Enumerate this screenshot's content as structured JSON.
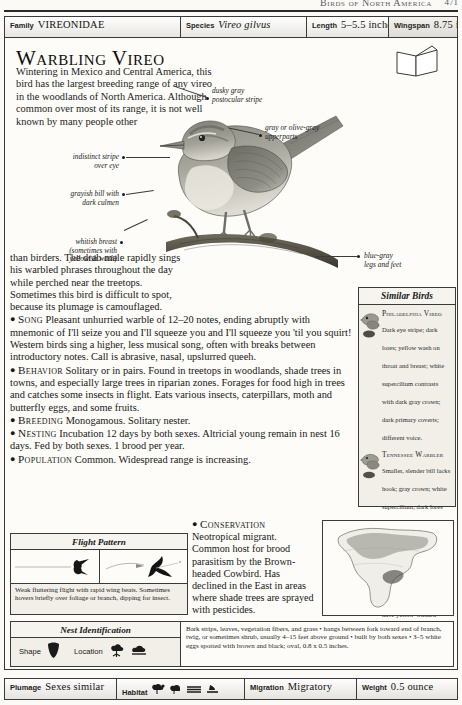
{
  "running_head": {
    "text": "Birds of North America",
    "page_number": "471"
  },
  "header": {
    "cells": [
      {
        "key": "Family",
        "value": "VIREONIDAE",
        "style": "smallcaps"
      },
      {
        "key": "Species",
        "value": "Vireo gilvus",
        "style": "italic"
      },
      {
        "key": "Length",
        "value": "5–5.5 inches",
        "style": "plain"
      },
      {
        "key": "Wingspan",
        "value": "8.75 inches",
        "style": "plain"
      }
    ]
  },
  "title": "Warbling Vireo",
  "intro": "Wintering in Mexico and Central America, this bird has the largest breeding range of any vireo in the woodlands of North America. Although common over most of its range, it is not well known by many people other",
  "callouts": [
    {
      "name": "postocular-stripe",
      "text": "dusky gray\npostocular stripe"
    },
    {
      "name": "upperparts",
      "text": "gray or olive-gray\nupperparts"
    },
    {
      "name": "eye-stripe",
      "text": "indistinct stripe\nover eye"
    },
    {
      "name": "bill",
      "text": "grayish bill with\ndark culmen"
    },
    {
      "name": "breast",
      "text": "whitish breast\n(sometimes with\nyellowish wash)"
    },
    {
      "name": "legs",
      "text": "blue-gray\nlegs and feet"
    }
  ],
  "body": {
    "continuation": "than birders. The drab male rapidly sings his warbled phrases throughout the day while perched near the treetops. Sometimes this bird is difficult to spot, because its plumage is camouflaged.",
    "sections": [
      {
        "label": "Song",
        "text": "Pleasant unhurried warble of 12–20 notes, ending abruptly with mnemonic of I'll seize you and I'll squeeze you and I'll squeeze you 'til you squirt! Western birds sing a higher, less musical song, often with breaks between introductory notes. Call is abrasive, nasal, upslurred queeh."
      },
      {
        "label": "Behavior",
        "text": "Solitary or in pairs. Found in treetops in woodlands, shade trees in towns, and especially large trees in riparian zones. Forages for food high in trees and catches some insects in flight. Eats various insects, caterpillars, moth and butterfly eggs, and some fruits."
      },
      {
        "label": "Breeding",
        "text": "Monogamous. Solitary nester."
      },
      {
        "label": "Nesting",
        "text": "Incubation 12 days by both sexes. Altricial young remain in nest 16 days. Fed by both sexes. 1 brood per year."
      },
      {
        "label": "Population",
        "text": "Common. Widespread range is increasing."
      }
    ],
    "conservation": {
      "label": "Conservation",
      "text": "Neotropical migrant. Common host for brood parasitism by the Brown-headed Cowbird. Has declined in the East in areas where shade trees are sprayed with pesticides."
    }
  },
  "similar_birds": {
    "title": "Similar Birds",
    "entries": [
      {
        "name": "Philadelphia Vireo",
        "description": "Dark eye stripe; dark lores; yellow wash on throat and breast; white supercilium contrasts with dark gray crown; dark primary coverts; different voice."
      },
      {
        "name": "Tennessee Warbler",
        "description": "Smaller, slender bill lacks hook; gray crown; white supercilium; dark lores and postocular stripe; white undertail coverts; greenish upperparts; different song • female, juvenile, and fall male have yellow-washed underparts."
      }
    ]
  },
  "flight_pattern": {
    "title": "Flight Pattern",
    "caption": "Weak fluttering flight with rapid wing beats. Sometimes hovers briefly over foliage or branch, dipping for insect."
  },
  "nest_identification": {
    "title": "Nest Identification",
    "shape_label": "Shape",
    "location_label": "Location",
    "description": "Bark strips, leaves, vegetation fibers, and grass • hangs between fork toward end of branch, twig, or sometimes shrub, usually 4–15 feet above ground • built by both sexes • 3–5 white eggs spotted with brown and black; oval, 0.8 x 0.5 inches."
  },
  "footer": {
    "cells": [
      {
        "key": "Plumage",
        "value": "Sexes similar",
        "icons": []
      },
      {
        "key": "Habitat",
        "value": "",
        "icons": [
          "tree-icon",
          "shrub-icon",
          "water-icon",
          "marsh-icon"
        ]
      },
      {
        "key": "Migration",
        "value": "Migratory",
        "icons": []
      },
      {
        "key": "Weight",
        "value": "0.5 ounce",
        "icons": []
      }
    ]
  },
  "colors": {
    "rule": "#2a2a2a",
    "panel_bg": "#f1efe8",
    "page_bg": "#fdfcf8",
    "ink": "#1a1a1a"
  }
}
